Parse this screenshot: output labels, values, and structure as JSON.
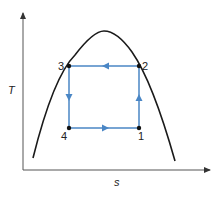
{
  "diagram": {
    "type": "T-s diagram (Carnot cycle under vapor dome)",
    "axes": {
      "y_label": "T",
      "x_label": "s"
    },
    "points": [
      {
        "id": "1",
        "label": "1",
        "x": 139,
        "y": 128
      },
      {
        "id": "2",
        "label": "2",
        "x": 139,
        "y": 66
      },
      {
        "id": "3",
        "label": "3",
        "x": 69,
        "y": 66
      },
      {
        "id": "4",
        "label": "4",
        "x": 69,
        "y": 128
      }
    ],
    "processes": [
      {
        "from": "1",
        "to": "2",
        "direction": "up"
      },
      {
        "from": "2",
        "to": "3",
        "direction": "left"
      },
      {
        "from": "3",
        "to": "4",
        "direction": "down"
      },
      {
        "from": "4",
        "to": "1",
        "direction": "right"
      }
    ],
    "colors": {
      "cycle": "#4a86c5",
      "dome": "#1a1a1a",
      "axes": "#555555"
    }
  }
}
